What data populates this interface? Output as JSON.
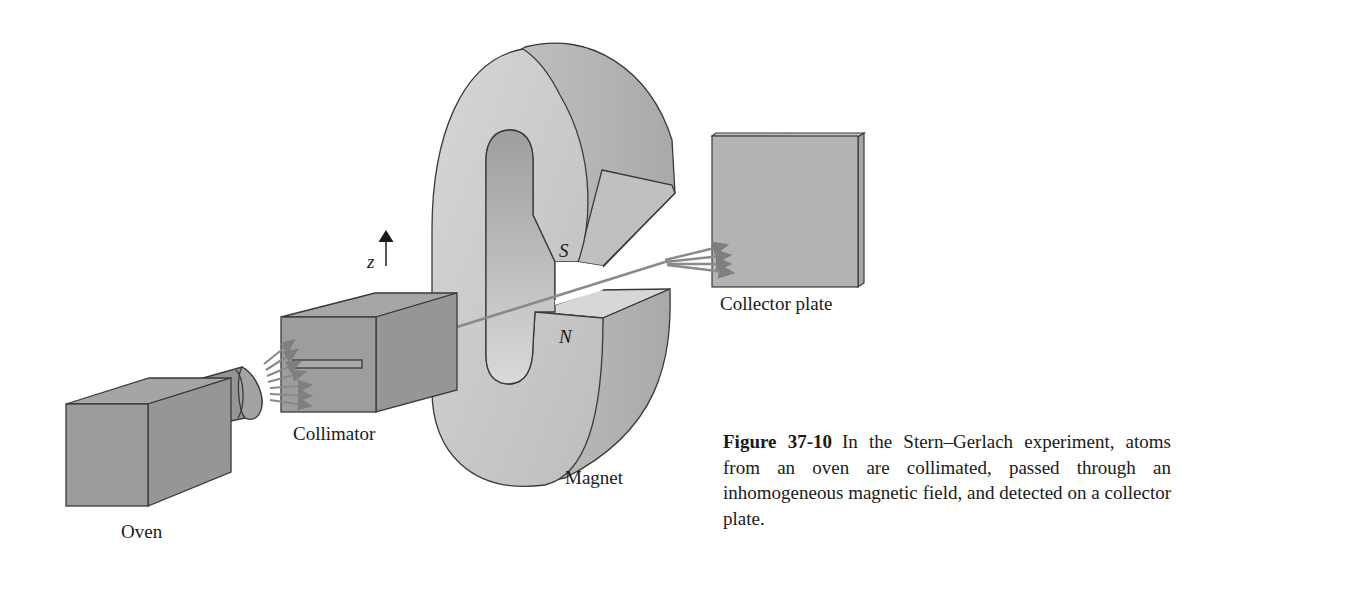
{
  "figure": {
    "labels": {
      "oven": "Oven",
      "collimator": "Collimator",
      "magnet": "Magnet",
      "collector_plate": "Collector plate",
      "south_pole": "S",
      "north_pole": "N",
      "axis": "z"
    },
    "colors": {
      "box_face": "#9a9a9a",
      "box_side": "#8c8c8c",
      "box_top": "#a8a8a8",
      "magnet_face": "#c8c8c8",
      "magnet_side": "#b4b4b4",
      "magnet_inner": "#a9a9a9",
      "plate_face": "#b0b0b0",
      "beam": "#7f7f7f",
      "outline": "#3a3a3a"
    }
  },
  "caption": {
    "figure_number": "Figure 37-10",
    "text": "In the Stern–Gerlach experiment, atoms from an oven are collimated, passed through an inhomogeneous magnetic field, and detected on a collector plate."
  }
}
